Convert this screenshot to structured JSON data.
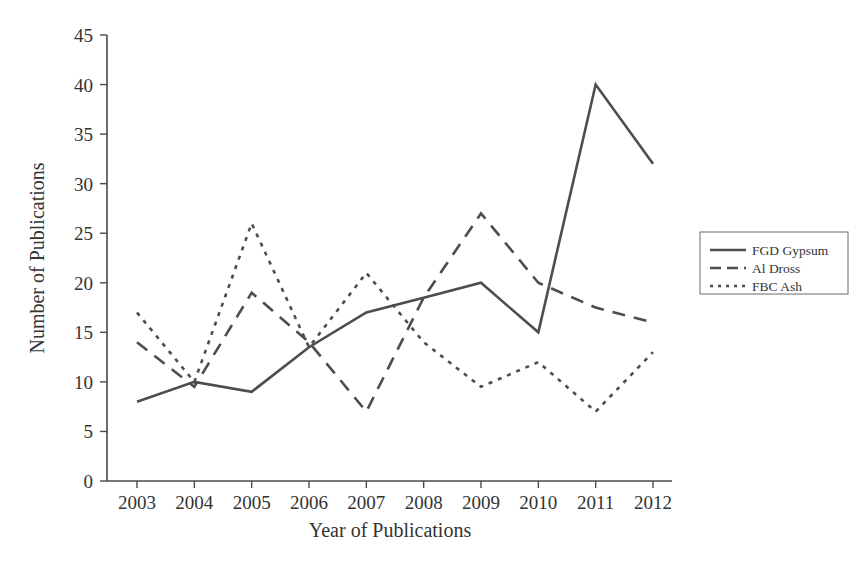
{
  "chart_data": {
    "type": "line",
    "title": "",
    "xlabel": "Year of Publications",
    "ylabel": "Number of Publications",
    "categories": [
      "2003",
      "2004",
      "2005",
      "2006",
      "2007",
      "2008",
      "2009",
      "2010",
      "2011",
      "2012"
    ],
    "x": [
      2003,
      2004,
      2005,
      2006,
      2007,
      2008,
      2009,
      2010,
      2011,
      2012
    ],
    "xlim": [
      2003,
      2012
    ],
    "ylim": [
      0,
      45
    ],
    "yticks": [
      0,
      5,
      10,
      15,
      20,
      25,
      30,
      35,
      40,
      45
    ],
    "ytick_labels": [
      "0",
      "5",
      "10",
      "15",
      "20",
      "25",
      "30",
      "35",
      "40",
      "45"
    ],
    "grid": false,
    "legend_position": "right-outside",
    "series": [
      {
        "name": "FGD Gypsum",
        "style": "solid",
        "color": "#4d4d4d",
        "values": [
          8,
          10,
          9,
          13.5,
          17,
          18.5,
          20,
          15,
          40,
          32
        ]
      },
      {
        "name": "Al Dross",
        "style": "dashed",
        "color": "#4d4d4d",
        "values": [
          14,
          9.5,
          19,
          14,
          7,
          18.5,
          27,
          20,
          17.5,
          16
        ]
      },
      {
        "name": "FBC Ash",
        "style": "dotted",
        "color": "#4d4d4d",
        "values": [
          17,
          10,
          26,
          13.5,
          21,
          14,
          9.5,
          12,
          7,
          13
        ]
      }
    ]
  },
  "legend": {
    "items": [
      {
        "label": "FGD Gypsum",
        "style": "solid"
      },
      {
        "label": "Al Dross",
        "style": "dashed"
      },
      {
        "label": "FBC Ash",
        "style": "dotted"
      }
    ]
  },
  "axes": {
    "x_title": "Year of Publications",
    "y_title": "Number of Publications"
  }
}
